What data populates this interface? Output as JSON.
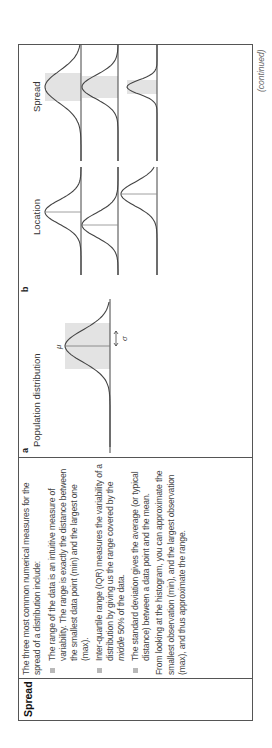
{
  "row": {
    "label": "Spread",
    "intro": "The three most common numerical measures for the spread of a distribution include:",
    "bullets": [
      {
        "text": "The range of the data is an intuitive measure of variability. The range is exactly the distance between the smallest data point (min) and the largest one (max)."
      },
      {
        "pre": "Inter-quartile range (IQR) measures the variability of a distribution by giving us the range covered by the ",
        "em": "middle",
        "post": " 50% of the data."
      },
      {
        "text": "The standard deviation gives the average (or typical distance) between a data point and the mean."
      }
    ],
    "closing": "From looking at the histogram, you can approximate the smallest observation (min), and the largest observation (max), and thus approximate the range."
  },
  "figure": {
    "panel_a": {
      "label": "a",
      "title": "Population distribution",
      "mu_symbol": "μ",
      "sigma_symbol": "σ"
    },
    "panel_b": {
      "label": "b",
      "location_title": "Location",
      "spread_title": "Spread"
    },
    "colors": {
      "curve": "#444444",
      "shade": "#e3e3e3"
    }
  },
  "footer": {
    "continued": "(continued)"
  }
}
